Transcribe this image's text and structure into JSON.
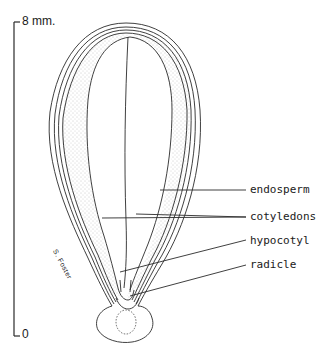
{
  "diagram": {
    "type": "seed longitudinal section",
    "scale_bar": {
      "top_label": "8 mm.",
      "bottom_label": "0"
    },
    "labels": [
      {
        "id": "endosperm",
        "text": "endosperm"
      },
      {
        "id": "cotyledons",
        "text": "cotyledons"
      },
      {
        "id": "hypocotyl",
        "text": "hypocotyl"
      },
      {
        "id": "radicle",
        "text": "radicle"
      }
    ],
    "signature": "S. Foster",
    "colors": {
      "line": "#2a2a2a",
      "stipple": "#9a9a9a",
      "background": "#ffffff"
    }
  }
}
